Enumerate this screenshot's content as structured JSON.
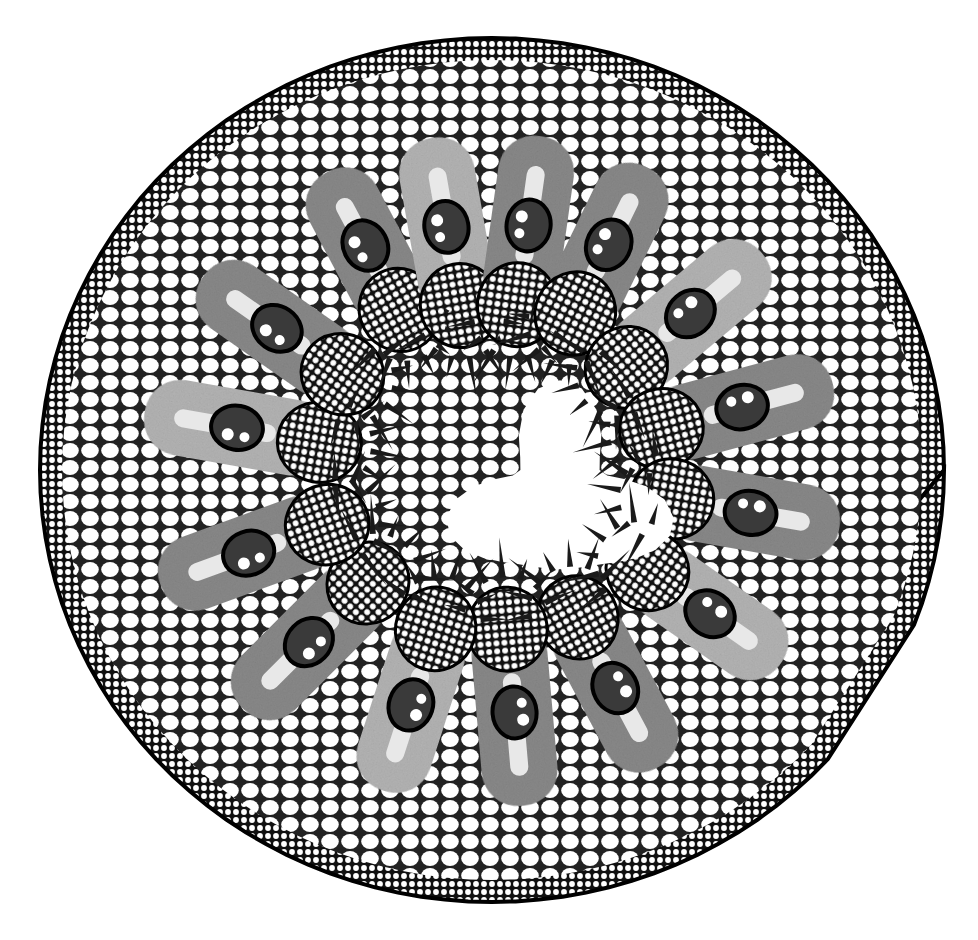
{
  "image": {
    "subject": "micrograph of a rolled grass leaf cross-section",
    "style": "grayscale light micrograph",
    "background_color": "#ffffff",
    "colors": {
      "cell_wall": "#111111",
      "cell_lumen": "#ffffff",
      "mesophyll": "#8a8a8a",
      "mesophyll_light": "#b5b5b5",
      "vascular_bundle": "#3a3a3a",
      "hair": "#1a1a1a"
    },
    "outline": {
      "cx": 492,
      "cy": 470,
      "rx": 452,
      "ry": 432
    },
    "notch": {
      "x": 870,
      "y": 600
    },
    "ridges": [
      {
        "angle": -118,
        "len": 230,
        "bundle": true
      },
      {
        "angle": -100,
        "len": 250,
        "bundle": true
      },
      {
        "angle": -82,
        "len": 250,
        "bundle": true
      },
      {
        "angle": -64,
        "len": 240,
        "bundle": true
      },
      {
        "angle": -40,
        "len": 260,
        "bundle": true
      },
      {
        "angle": -15,
        "len": 260,
        "bundle": true
      },
      {
        "angle": 10,
        "len": 250,
        "bundle": true
      },
      {
        "angle": 35,
        "len": 240,
        "bundle": true
      },
      {
        "angle": 62,
        "len": 250,
        "bundle": true
      },
      {
        "angle": 85,
        "len": 260,
        "bundle": true
      },
      {
        "angle": 108,
        "len": 250,
        "bundle": true
      },
      {
        "angle": 135,
        "len": 260,
        "bundle": true
      },
      {
        "angle": 160,
        "len": 260,
        "bundle": true
      },
      {
        "angle": 190,
        "len": 260,
        "bundle": true
      },
      {
        "angle": 215,
        "len": 250,
        "bundle": true
      }
    ],
    "watermark": ""
  }
}
